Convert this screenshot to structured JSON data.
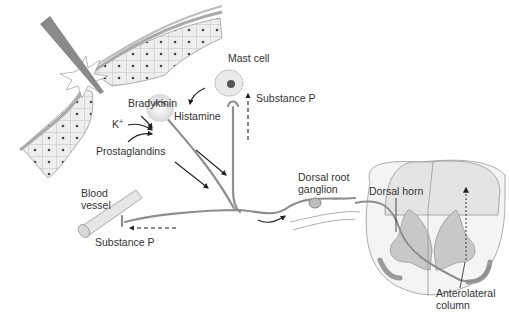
{
  "labels": {
    "mast_cell": "Mast cell",
    "substance_p_top": "Substance P",
    "bradykinin": "Bradykinin",
    "histamine": "Histamine",
    "k_plus": "K",
    "k_plus_sup": "+",
    "prostaglandins": "Prostaglandins",
    "blood_vessel_1": "Blood",
    "blood_vessel_2": "vessel",
    "substance_p_bottom": "Substance P",
    "dorsal_root_1": "Dorsal root",
    "dorsal_root_2": "ganglion",
    "dorsal_horn": "Dorsal horn",
    "anterolateral_1": "Anterolateral",
    "anterolateral_2": "column"
  },
  "colors": {
    "tissue": "#e9e9e9",
    "tissue_stroke": "#9a9a9a",
    "nerve": "#8e8e8e",
    "gray_matter": "#c8c8c8",
    "white_matter": "#eeeeee",
    "arrow": "#222222",
    "blade": "#8a8a8a"
  }
}
